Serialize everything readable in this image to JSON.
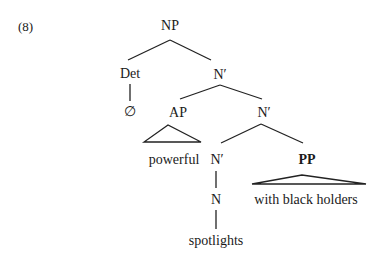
{
  "example_number": "(8)",
  "tree": {
    "root": "NP",
    "det": "Det",
    "det_child": "∅",
    "nbar1": "N′",
    "ap": "AP",
    "ap_text": "powerful",
    "nbar2": "N′",
    "nbar3": "N′",
    "pp": "PP",
    "pp_text": "with black holders",
    "n": "N",
    "n_text": "spotlights"
  },
  "colors": {
    "text": "#1a1a1a",
    "lines": "#222222",
    "background": "#ffffff"
  }
}
